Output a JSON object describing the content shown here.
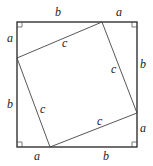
{
  "diagram": {
    "outer_square": {
      "x1": 17,
      "y1": 22,
      "x2": 137,
      "y2": 147
    },
    "inner_square": {
      "points": [
        [
          102,
          22
        ],
        [
          137,
          113
        ],
        [
          50,
          147
        ],
        [
          17,
          58
        ]
      ]
    },
    "labels": [
      {
        "id": "top-b",
        "text": "b",
        "x": 55,
        "y": 16
      },
      {
        "id": "top-a",
        "text": "a",
        "x": 116,
        "y": 16
      },
      {
        "id": "left-a",
        "text": "a",
        "x": 7,
        "y": 42
      },
      {
        "id": "left-b",
        "text": "b",
        "x": 7,
        "y": 108
      },
      {
        "id": "right-b",
        "text": "b",
        "x": 140,
        "y": 68
      },
      {
        "id": "right-a",
        "text": "a",
        "x": 140,
        "y": 132
      },
      {
        "id": "bottom-a",
        "text": "a",
        "x": 34,
        "y": 160
      },
      {
        "id": "bottom-b",
        "text": "b",
        "x": 103,
        "y": 160
      },
      {
        "id": "inner-top-c",
        "text": "c",
        "x": 62,
        "y": 47
      },
      {
        "id": "inner-right-c",
        "text": "c",
        "x": 111,
        "y": 73
      },
      {
        "id": "inner-left-c",
        "text": "c",
        "x": 40,
        "y": 113
      },
      {
        "id": "inner-bottom-c",
        "text": "c",
        "x": 97,
        "y": 125
      }
    ],
    "right_angle_markers": [
      "top-left",
      "top-right",
      "bottom-left",
      "bottom-right"
    ],
    "stroke_color": "#333333"
  }
}
